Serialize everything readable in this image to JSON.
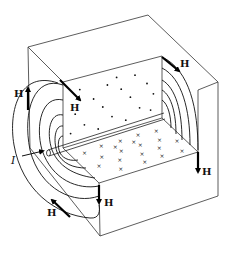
{
  "figure": {
    "current_label": "I",
    "field_label": "H",
    "field_arrow_count": 6,
    "dot_symbol": "•",
    "cross_symbol": "×",
    "colors": {
      "ink": "#111111",
      "background": "#ffffff"
    }
  },
  "labels": {
    "h_left": "H",
    "h_top_inner": "H",
    "h_top_right": "H",
    "h_right_lower": "H",
    "h_bottom_front": "H",
    "h_bottom_left": "H",
    "current": "I"
  }
}
